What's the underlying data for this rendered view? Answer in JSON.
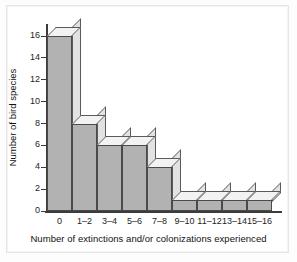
{
  "chart_data": {
    "type": "bar",
    "title": "",
    "subtitle": "",
    "xlabel": "Number of extinctions and/or colonizations experienced",
    "ylabel": "Number of bird species",
    "categories": [
      "0",
      "1–2",
      "3–4",
      "5–6",
      "7–8",
      "9–10",
      "11–12",
      "13–14",
      "15–16"
    ],
    "values": [
      16,
      8,
      6,
      6,
      4,
      1,
      1,
      1,
      1
    ],
    "ylim": [
      0,
      16
    ],
    "xlim_note": "categorical bins, contiguous bars",
    "y_ticks": [
      0,
      2,
      4,
      6,
      8,
      10,
      12,
      14,
      16
    ],
    "y_tick_labels": [
      "0",
      "2",
      "4",
      "6",
      "8",
      "10",
      "12",
      "14",
      "16"
    ],
    "grid": false,
    "legend": false,
    "legend_position": "none",
    "style": "3d-isometric-bars",
    "colors": {
      "bar_face": "#b2b2b2",
      "bar_top": "#f2f2f2",
      "bar_side": "#e2e2e2",
      "bar_outline": "#4a4a4a",
      "axis": "#3b3b3b",
      "text": "#111111",
      "background": "#ffffff",
      "frame": "#e6e6e6"
    }
  }
}
